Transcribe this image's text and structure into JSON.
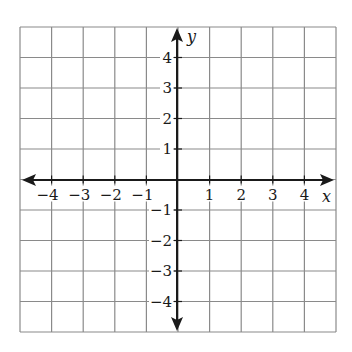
{
  "diagram": {
    "type": "coordinate-plane",
    "x_axis": {
      "label": "x",
      "min": -5,
      "max": 5,
      "tick_labels": [
        "−4",
        "−3",
        "−2",
        "−1",
        "1",
        "2",
        "3",
        "4"
      ],
      "tick_values": [
        -4,
        -3,
        -2,
        -1,
        1,
        2,
        3,
        4
      ]
    },
    "y_axis": {
      "label": "y",
      "min": -5,
      "max": 5,
      "tick_labels": [
        "4",
        "3",
        "2",
        "1",
        "−1",
        "−2",
        "−3",
        "−4"
      ],
      "tick_values": [
        4,
        3,
        2,
        1,
        -1,
        -2,
        -3,
        -4
      ]
    },
    "grid": {
      "cells_x": 10,
      "cells_y": 10,
      "step": 1
    },
    "colors": {
      "grid_line": "#8a8a8a",
      "axis_line": "#1a1a1a",
      "background": "#ffffff",
      "text": "#1a1a1a"
    }
  }
}
